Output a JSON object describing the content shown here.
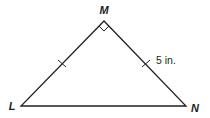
{
  "diagram": {
    "type": "right isosceles triangle",
    "vertices": [
      {
        "id": "M",
        "label": "M",
        "x": 104,
        "y": 21,
        "label_x": 104,
        "label_y": 14
      },
      {
        "id": "L",
        "label": "L",
        "x": 21,
        "y": 106,
        "label_x": 12,
        "label_y": 110
      },
      {
        "id": "N",
        "label": "N",
        "x": 186,
        "y": 106,
        "label_x": 195,
        "label_y": 112
      }
    ],
    "right_angle_at": "M",
    "congruent_sides": [
      "LM",
      "MN"
    ],
    "side_label": {
      "side": "MN",
      "text": "5 in.",
      "x": 156,
      "y": 64
    },
    "stroke_color": "#231f20"
  }
}
